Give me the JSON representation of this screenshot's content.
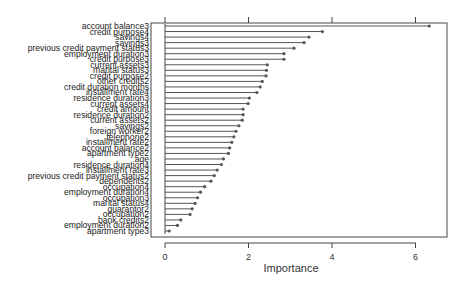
{
  "chart_data": {
    "type": "bar",
    "orientation": "horizontal",
    "style": "lollipop",
    "title": "",
    "xlabel": "Importance",
    "ylabel": "",
    "xlim": [
      -0.35,
      6.85
    ],
    "xticks": [
      0,
      2,
      4,
      6
    ],
    "grid": false,
    "legend": null,
    "categories": [
      "account balance3",
      "credit purpose4",
      "savings4",
      "savings3",
      "previous credit payment status3",
      "employment duration3",
      "credit purpose3",
      "current assets3",
      "marital status3",
      "credit purpose2",
      "other credits2",
      "credit duration months",
      "installment rate4",
      "residence duration3",
      "current assets4",
      "credit amount",
      "residence duration2",
      "current assets2",
      "savings2",
      "foreign worker2",
      "telephone2",
      "installment rate2",
      "account balance2",
      "apartment type2",
      "age",
      "residence duration4",
      "installment rate3",
      "previous credit payment status2",
      "dependents2",
      "occupation4",
      "employment duration4",
      "occupation3",
      "marital status4",
      "guarantor2",
      "occupation2",
      "bank credits2",
      "employment duration2",
      "apartment type3"
    ],
    "values": [
      6.33,
      3.77,
      3.45,
      3.33,
      3.09,
      2.85,
      2.85,
      2.45,
      2.43,
      2.42,
      2.33,
      2.28,
      2.2,
      2.02,
      1.99,
      1.87,
      1.87,
      1.85,
      1.77,
      1.7,
      1.65,
      1.6,
      1.55,
      1.52,
      1.4,
      1.35,
      1.25,
      1.18,
      1.1,
      0.95,
      0.85,
      0.78,
      0.72,
      0.65,
      0.6,
      0.38,
      0.3,
      0.1
    ]
  },
  "axis": {
    "tick_labels": [
      "0",
      "2",
      "4",
      "6"
    ],
    "xlabel": "Importance"
  },
  "colors": {
    "bar": "#555555",
    "axis": "#444444",
    "text": "#222222"
  }
}
